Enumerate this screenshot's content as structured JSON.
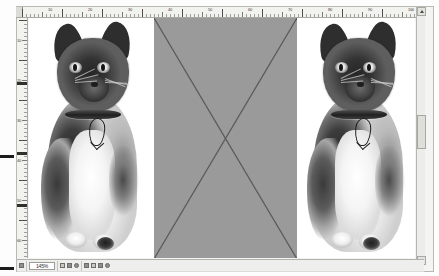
{
  "app": {
    "title": "Document Layout View",
    "document_background": "#ffffff",
    "frame_background": "#f4f4f2"
  },
  "rulers": {
    "horizontal": {
      "name": "horizontal-ruler",
      "unit": "mm",
      "labels": [
        "10",
        "20",
        "30",
        "40",
        "50",
        "60",
        "70",
        "80",
        "90",
        "100"
      ],
      "label_positions": [
        38,
        78,
        118,
        158,
        198,
        238,
        278,
        318,
        358,
        398
      ],
      "major_every_px": 40,
      "minor_every_px": 4
    },
    "vertical": {
      "name": "vertical-ruler",
      "unit": "mm",
      "labels": [
        "10",
        "20",
        "30",
        "40",
        "50",
        "60"
      ],
      "label_positions": [
        28,
        68,
        108,
        148,
        188,
        228
      ],
      "major_every_px": 40,
      "minor_every_px": 4,
      "markers": [
        82,
        152,
        204
      ]
    }
  },
  "canvas": {
    "objects": [
      {
        "name": "image-frame-left",
        "kind": "photo",
        "caption": "Black and white kitten with collar and fish-shaped tag",
        "selected": false
      },
      {
        "name": "image-frame-placeholder",
        "kind": "placeholder",
        "caption": "Empty graphic frame",
        "fill_color": "#9a9a9a",
        "cross_color": "#5a5a5a",
        "selected": false
      },
      {
        "name": "image-frame-right",
        "kind": "photo",
        "caption": "Black and white kitten with collar and fish-shaped tag",
        "selected": false
      }
    ]
  },
  "scrollbar": {
    "vertical": {
      "up_arrow": "▲",
      "down_arrow": "▼",
      "thumb_position_percent": 42
    }
  },
  "statusbar": {
    "page_icon": "page-icon",
    "zoom_value": "145%",
    "cells": [
      {
        "name": "view-mode-cell",
        "icons": [
          "layout-icon",
          "columns-icon",
          "single-page-icon"
        ]
      },
      {
        "name": "object-tools-cell",
        "icons": [
          "select-icon",
          "text-icon",
          "frame-icon",
          "rotate-icon"
        ]
      }
    ],
    "left_marker": "●",
    "right_marker": "◢"
  },
  "colors": {
    "placeholder_gray": "#9a9a9a",
    "ruler_background": "#f2f2ee",
    "chrome": "#eeeeec",
    "border": "#b9b9b4"
  }
}
